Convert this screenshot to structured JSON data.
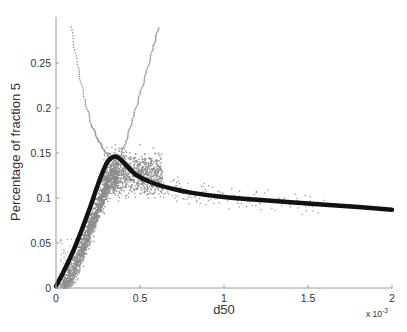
{
  "chart_data": {
    "type": "scatter",
    "title": "",
    "xlabel": "d50",
    "ylabel": "Percentage of fraction 5",
    "x_multiplier_label": "x 10",
    "x_multiplier_exponent": "-3",
    "xlim": [
      0,
      2
    ],
    "ylim": [
      0,
      0.29
    ],
    "grid": false,
    "legend": null,
    "x_ticks": [
      0,
      0.5,
      1,
      1.5,
      2
    ],
    "x_tick_labels": [
      "0",
      "0.5",
      "1",
      "1.5",
      "2"
    ],
    "y_ticks": [
      0,
      0.05,
      0.1,
      0.15,
      0.2,
      0.25
    ],
    "y_tick_labels": [
      "0",
      "0.05",
      "0.1",
      "0.15",
      "0.2",
      "0.25"
    ],
    "series": [
      {
        "name": "fitted curve",
        "kind": "line",
        "color": "#111111",
        "x": [
          0,
          0.05,
          0.1,
          0.15,
          0.2,
          0.25,
          0.3,
          0.35,
          0.4,
          0.45,
          0.5,
          0.6,
          0.7,
          0.8,
          1.0,
          1.2,
          1.5,
          1.8,
          2.0
        ],
        "y": [
          0.002,
          0.02,
          0.04,
          0.063,
          0.088,
          0.115,
          0.138,
          0.146,
          0.14,
          0.13,
          0.123,
          0.115,
          0.11,
          0.106,
          0.101,
          0.098,
          0.094,
          0.09,
          0.087
        ]
      },
      {
        "name": "left envelope",
        "kind": "dotted-line",
        "color": "#8a8a8a",
        "x": [
          0.09,
          0.13,
          0.17,
          0.21,
          0.25,
          0.29,
          0.33
        ],
        "y": [
          0.29,
          0.245,
          0.21,
          0.182,
          0.165,
          0.152,
          0.142
        ]
      },
      {
        "name": "right envelope",
        "kind": "dotted-line",
        "color": "#8a8a8a",
        "x": [
          0.38,
          0.42,
          0.46,
          0.5,
          0.54,
          0.58,
          0.61
        ],
        "y": [
          0.145,
          0.165,
          0.19,
          0.215,
          0.24,
          0.268,
          0.29
        ]
      },
      {
        "name": "scatter samples",
        "kind": "scatter",
        "color": "#8c8c8c",
        "description": "dense cloud following the rising curve from 0 to ~0.35e-3, spreading 0.08–0.17 around the peak, then sparse points near 0.09–0.12 out to ~1.6e-3"
      }
    ]
  }
}
